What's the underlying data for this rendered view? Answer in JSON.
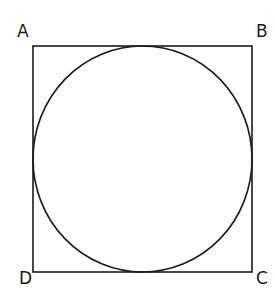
{
  "diagram": {
    "type": "geometry",
    "stroke_color": "#1a1a1a",
    "background": "#ffffff",
    "square": {
      "x": 33,
      "y": 46,
      "width": 219,
      "height": 226,
      "stroke_width": 1.6
    },
    "circle": {
      "cx": 142.5,
      "cy": 159,
      "rx": 109.5,
      "ry": 113,
      "stroke_width": 1.6
    },
    "vertices": [
      {
        "label": "A",
        "position": "top-left",
        "x": 17,
        "y": 37
      },
      {
        "label": "B",
        "position": "top-right",
        "x": 256,
        "y": 37
      },
      {
        "label": "C",
        "position": "bottom-right",
        "x": 256,
        "y": 284
      },
      {
        "label": "D",
        "position": "bottom-left",
        "x": 19,
        "y": 284
      }
    ]
  }
}
